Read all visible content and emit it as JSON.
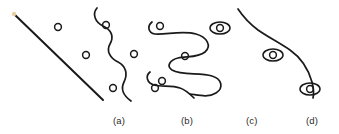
{
  "figure": {
    "background_color": "#ffffff",
    "ink_color": "#1a1a1a",
    "speck_color": "#e8cfa4",
    "stroke_width": 1.6,
    "panels": [
      {
        "id": "a",
        "label": "(a)",
        "label_x": 113,
        "label_y": 115,
        "description": "straight diagonal line with three free circles",
        "line": {
          "x1": 14,
          "y1": 14,
          "x2": 103,
          "y2": 100
        },
        "circles": [
          {
            "cx": 58,
            "cy": 27,
            "r": 3.4
          },
          {
            "cx": 86,
            "cy": 55,
            "r": 3.4
          },
          {
            "cx": 113,
            "cy": 88,
            "r": 3.4
          }
        ],
        "ellipses": [],
        "speck": {
          "cx": 14,
          "cy": 14,
          "r": 2.2
        }
      },
      {
        "id": "b",
        "label": "(b)",
        "label_x": 181,
        "label_y": 115,
        "description": "wavy serpentine curve with circles nestled in its bends",
        "path": "M 97 8 C 92 14, 95 22, 103 26 C 112 30, 114 37, 110 44 C 106 51, 110 58, 118 62 C 126 66, 128 74, 124 82 C 120 90, 124 96, 131 101",
        "circles": [
          {
            "cx": 106,
            "cy": 25,
            "r": 3.4
          },
          {
            "cx": 134,
            "cy": 54,
            "r": 3.4
          },
          {
            "cx": 155,
            "cy": 88,
            "r": 3.4
          }
        ],
        "ellipses": []
      },
      {
        "id": "c",
        "label": "(c)",
        "label_x": 246,
        "label_y": 115,
        "description": "tightly hooked serpentine curves with circles captured in the hooks",
        "paths": [
          "M 152 22 C 147 26, 148 33, 155 34 C 166 35, 182 30, 196 34 C 207 37, 212 46, 205 52 C 198 58, 186 56, 178 58 C 170 60, 166 66, 172 70 C 182 76, 200 72, 212 76 C 222 79, 224 88, 216 93 C 208 98, 198 95, 190 94",
          "M 150 72 C 145 76, 147 83, 154 85 C 162 87, 172 85, 180 88 C 186 90, 190 94, 194 98"
        ],
        "circles": [
          {
            "cx": 160,
            "cy": 26,
            "r": 3.4
          },
          {
            "cx": 185,
            "cy": 56,
            "r": 3.4
          },
          {
            "cx": 162,
            "cy": 81,
            "r": 3.4
          }
        ],
        "ellipses": []
      },
      {
        "id": "d",
        "label": "(d)",
        "label_x": 306,
        "label_y": 115,
        "description": "long sweeping curve with circles enclosed inside elongated ellipses",
        "paths": [
          "M 238 9 C 244 18, 250 24, 258 30 C 268 37, 278 42, 290 50 C 300 57, 308 68, 312 82 C 314 90, 314 94, 313 98"
        ],
        "circles": [
          {
            "cx": 220,
            "cy": 28,
            "r": 3.4
          },
          {
            "cx": 273,
            "cy": 55,
            "r": 3.4
          },
          {
            "cx": 310,
            "cy": 89,
            "r": 3.4
          }
        ],
        "ellipses": [
          {
            "cx": 220,
            "cy": 28,
            "rx": 10,
            "ry": 6
          },
          {
            "cx": 273,
            "cy": 55,
            "rx": 10,
            "ry": 6
          },
          {
            "cx": 310,
            "cy": 89,
            "rx": 10,
            "ry": 6
          }
        ]
      }
    ]
  }
}
